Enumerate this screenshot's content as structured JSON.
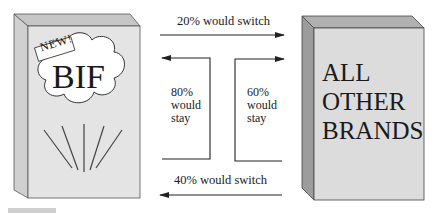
{
  "diagram": {
    "type": "brand-switching",
    "left_box": {
      "name": "BIF",
      "badge": "NEW!"
    },
    "right_box": {
      "lines": [
        "ALL",
        "OTHER",
        "BRANDS"
      ]
    },
    "flows": [
      {
        "from": "BIF",
        "to": "ALL OTHER BRANDS",
        "label": "20% would switch",
        "percent": 20
      },
      {
        "from": "ALL OTHER BRANDS",
        "to": "BIF",
        "label": "40% would switch",
        "percent": 40
      },
      {
        "from": "BIF",
        "to": "BIF",
        "label_lines": [
          "80%",
          "would",
          "stay"
        ],
        "percent": 80
      },
      {
        "from": "ALL OTHER BRANDS",
        "to": "ALL OTHER BRANDS",
        "label_lines": [
          "60%",
          "would",
          "stay"
        ],
        "percent": 60
      }
    ]
  },
  "colors": {
    "box_face": "#e2e2e2",
    "box_side": "#c8c8c8",
    "right_box_side": "#9a9a9a",
    "right_box_top": "#b4b4b4",
    "line": "#222222"
  }
}
